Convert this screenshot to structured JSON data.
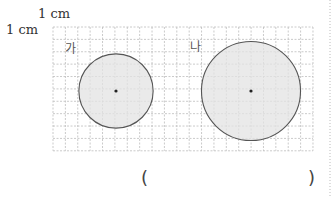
{
  "scale": {
    "horizontal_label": "1 cm",
    "vertical_label": "1 cm"
  },
  "grid": {
    "x": 53,
    "y": 27,
    "cols": 21,
    "rows": 10,
    "cell": 12.38,
    "line_color": "#bdbdbd"
  },
  "circles": [
    {
      "label": "가",
      "cx": 116,
      "cy": 91,
      "r_cells": 3,
      "fill": "#e3e3e3",
      "stroke": "#555555"
    },
    {
      "label": "나",
      "cx": 251,
      "cy": 91,
      "r_cells": 4,
      "fill": "#e3e3e3",
      "stroke": "#555555"
    }
  ],
  "answer": {
    "open": "(",
    "close": ")",
    "value": ""
  }
}
